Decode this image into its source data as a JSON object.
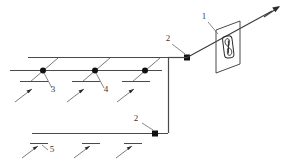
{
  "diagram": {
    "background_color": "#ffffff",
    "line_color": "#4a4a4a",
    "node_color": "#111111",
    "label_color": "#3a3a3a",
    "labels": [
      {
        "id": "label-1",
        "text": "1",
        "x": 204,
        "y": 19,
        "refers_to": "fan-unit-panel"
      },
      {
        "id": "label-2-upper",
        "text": "2",
        "x": 168,
        "y": 41,
        "refers_to": "upper-junction-node"
      },
      {
        "id": "label-3",
        "text": "3",
        "x": 53,
        "y": 92,
        "refers_to": "first-branch-node"
      },
      {
        "id": "label-4",
        "text": "4",
        "x": 106,
        "y": 92,
        "refers_to": "second-branch-node"
      },
      {
        "id": "label-2-lower",
        "text": "2",
        "x": 136,
        "y": 121,
        "refers_to": "lower-junction-node"
      },
      {
        "id": "label-5",
        "text": "5",
        "x": 50,
        "y": 152,
        "refers_to": "lower-duct-line"
      }
    ],
    "components": {
      "fan_unit": {
        "name": "fan-unit-panel",
        "shape": "parallelogram",
        "inner": "fan-impeller-symbol"
      },
      "upper_duct": {
        "name": "upper-duct-line",
        "from_x": 28,
        "to_x": 168,
        "y": 57
      },
      "branch_duct": {
        "name": "branch-duct-line",
        "from_x": 10,
        "to_x": 160,
        "y": 70
      },
      "lower_duct": {
        "name": "lower-duct-line",
        "from_x": 32,
        "to_x": 168,
        "y": 133
      },
      "riser": {
        "name": "vertical-riser-line",
        "x": 168,
        "from_y": 57,
        "to_y": 133
      },
      "outlet": {
        "name": "outlet-arrow",
        "direction": "up-right"
      }
    },
    "branch_nodes": [
      {
        "name": "first-branch-node",
        "x": 43,
        "y": 70
      },
      {
        "name": "second-branch-node",
        "x": 95,
        "y": 70
      },
      {
        "name": "third-branch-node",
        "x": 145,
        "y": 70
      }
    ],
    "junction_nodes": [
      {
        "name": "upper-junction-node",
        "x": 187,
        "y": 58
      },
      {
        "name": "lower-junction-node",
        "x": 155,
        "y": 133
      }
    ],
    "inlet_arrows_upper": [
      {
        "name": "inlet-arrow-1",
        "x": 25,
        "y": 94
      },
      {
        "name": "inlet-arrow-2",
        "x": 78,
        "y": 94
      },
      {
        "name": "inlet-arrow-3",
        "x": 128,
        "y": 94
      }
    ],
    "inlet_arrows_lower": [
      {
        "name": "inlet-arrow-4",
        "x": 36,
        "y": 152
      },
      {
        "name": "inlet-arrow-5",
        "x": 88,
        "y": 152
      },
      {
        "name": "inlet-arrow-6",
        "x": 130,
        "y": 152
      }
    ]
  }
}
